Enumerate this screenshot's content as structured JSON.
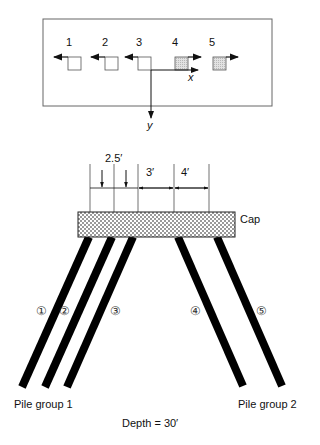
{
  "top_view": {
    "piles": [
      {
        "label": "1",
        "shaded": false,
        "direction": "left"
      },
      {
        "label": "2",
        "shaded": false,
        "direction": "left"
      },
      {
        "label": "3",
        "shaded": false,
        "direction": "left"
      },
      {
        "label": "4",
        "shaded": true,
        "direction": "right"
      },
      {
        "label": "5",
        "shaded": true,
        "direction": "right"
      }
    ],
    "axis_x": "x",
    "axis_y": "y"
  },
  "elevation": {
    "dimensions": [
      "2.5′",
      "3′",
      "4′"
    ],
    "cap_label": "Cap",
    "pile_markers": [
      "①",
      "②",
      "③",
      "④",
      "⑤"
    ],
    "group1_label": "Pile group 1",
    "group2_label": "Pile group 2",
    "depth_label": "Depth = 30′"
  },
  "colors": {
    "line": "#111111",
    "shade": "#d8d8d8",
    "frame": "#666666"
  }
}
